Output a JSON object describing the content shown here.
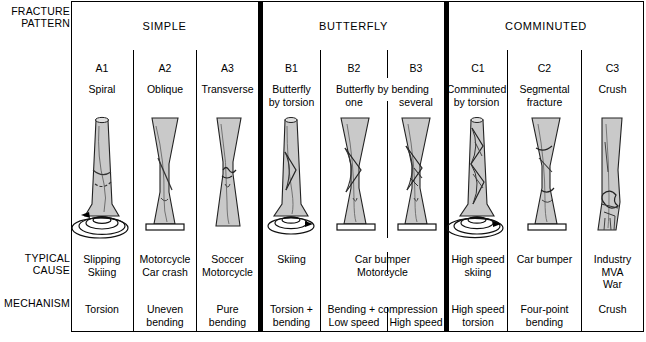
{
  "row_labels": {
    "pattern": "FRACTURE\nPATTERN",
    "typical_cause": "TYPICAL\nCAUSE",
    "mechanism": "MECHANISM"
  },
  "groups": [
    {
      "name": "SIMPLE"
    },
    {
      "name": "BUTTERFLY"
    },
    {
      "name": "COMMINUTED"
    }
  ],
  "columns": [
    {
      "code": "A1",
      "name": "Spiral",
      "cause": "Slipping\nSkiing",
      "mechanism": "Torsion",
      "bone": "spiral-torsion"
    },
    {
      "code": "A2",
      "name": "Oblique",
      "cause": "Motorcycle\nCar crash",
      "mechanism": "Uneven\nbending",
      "bone": "oblique-plate"
    },
    {
      "code": "A3",
      "name": "Transverse",
      "cause": "Soccer\nMotorcycle",
      "mechanism": "Pure\nbending",
      "bone": "transverse"
    },
    {
      "code": "B1",
      "name": "Butterfly\nby torsion",
      "cause": "Skiing",
      "mechanism": "Torsion +\nbending",
      "bone": "butterfly-torsion"
    },
    {
      "code": "B2",
      "name": "one",
      "cause": "",
      "mechanism": "Low speed",
      "bone": "butterfly-one"
    },
    {
      "code": "B3",
      "name": "several",
      "cause": "",
      "mechanism": "High speed",
      "bone": "butterfly-several"
    },
    {
      "code": "C1",
      "name": "Comminuted\nby torsion",
      "cause": "High speed\nskiing",
      "mechanism": "High speed\ntorsion",
      "bone": "comminuted-torsion"
    },
    {
      "code": "C2",
      "name": "Segmental\nfracture",
      "cause": "Car bumper",
      "mechanism": "Four-point\nbending",
      "bone": "segmental"
    },
    {
      "code": "C3",
      "name": "Crush",
      "cause": "Industry\nMVA\nWar",
      "mechanism": "Crush",
      "bone": "crush"
    }
  ],
  "spans": {
    "b_name": "Butterfly by bending",
    "b_cause": "Car bumper\nMotorcycle",
    "b_mechanism": "Bending + compression"
  },
  "colors": {
    "ink": "#000000",
    "bone_fill": "#c9c9c9",
    "bone_light": "#dedede",
    "background": "#ffffff"
  }
}
